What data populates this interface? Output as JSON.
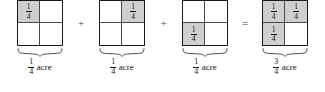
{
  "figure": {
    "shade_color": "#cfcfcf",
    "line_color": "#1a1a1a",
    "unit_label": "acre",
    "operators": {
      "plus": "+",
      "equals": "="
    },
    "terms": [
      {
        "name": "addend-1",
        "shaded_cells": [
          true,
          false,
          false,
          false
        ],
        "cell_labels": [
          {
            "numerator": "1",
            "denominator": "4"
          },
          null,
          null,
          null
        ],
        "caption": {
          "numerator": "1",
          "denominator": "4",
          "unit": "acre"
        }
      },
      {
        "name": "addend-2",
        "shaded_cells": [
          false,
          true,
          false,
          false
        ],
        "cell_labels": [
          null,
          {
            "numerator": "1",
            "denominator": "4"
          },
          null,
          null
        ],
        "caption": {
          "numerator": "1",
          "denominator": "4",
          "unit": "acre"
        }
      },
      {
        "name": "addend-3",
        "shaded_cells": [
          false,
          false,
          true,
          false
        ],
        "cell_labels": [
          null,
          null,
          {
            "numerator": "1",
            "denominator": "4"
          },
          null
        ],
        "caption": {
          "numerator": "1",
          "denominator": "4",
          "unit": "acre"
        }
      },
      {
        "name": "sum",
        "shaded_cells": [
          true,
          true,
          true,
          false
        ],
        "cell_labels": [
          {
            "numerator": "1",
            "denominator": "4"
          },
          {
            "numerator": "1",
            "denominator": "4"
          },
          {
            "numerator": "1",
            "denominator": "4"
          },
          null
        ],
        "caption": {
          "numerator": "3",
          "denominator": "4",
          "unit": "acre"
        }
      }
    ]
  }
}
